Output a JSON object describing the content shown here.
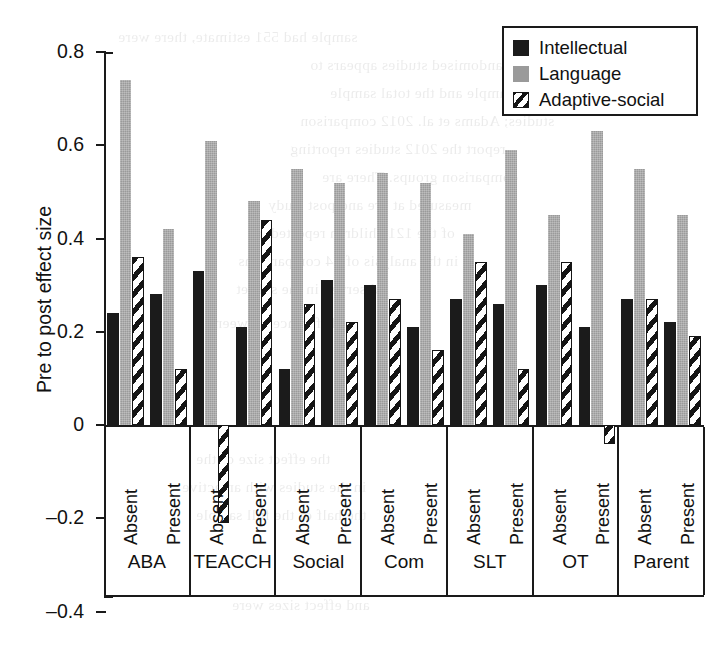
{
  "chart_data": {
    "type": "bar",
    "title": "",
    "xlabel": "",
    "ylabel": "Pre to post effect size",
    "ylim": [
      -0.4,
      0.8
    ],
    "yticks": [
      "0.8",
      "0.6",
      "0.4",
      "0.2",
      "0",
      "–0.2",
      "–0.4"
    ],
    "ytick_values": [
      0.8,
      0.6,
      0.4,
      0.2,
      0,
      -0.2,
      -0.4
    ],
    "grid": false,
    "legend_position": "top-right",
    "legend": [
      "Intellectual",
      "Language",
      "Adaptive-social"
    ],
    "group_label_row": [
      "ABA",
      "TEACCH",
      "Social",
      "Com",
      "SLT",
      "OT",
      "Parent"
    ],
    "subcategories": [
      "Absent",
      "Present"
    ],
    "categories": [
      "ABA Absent",
      "ABA Present",
      "TEACCH Absent",
      "TEACCH Present",
      "Social Absent",
      "Social Present",
      "Com Absent",
      "Com Present",
      "SLT Absent",
      "SLT Present",
      "OT Absent",
      "OT Present",
      "Parent Absent",
      "Parent Present"
    ],
    "series": [
      {
        "name": "Intellectual",
        "color": "#1b1b1b",
        "values": [
          0.24,
          0.28,
          0.33,
          0.21,
          0.12,
          0.31,
          0.3,
          0.21,
          0.27,
          0.26,
          0.3,
          0.21,
          0.27,
          0.22
        ]
      },
      {
        "name": "Language",
        "color": "#9a9a9a",
        "values": [
          0.74,
          0.42,
          0.61,
          0.48,
          0.55,
          0.52,
          0.54,
          0.52,
          0.41,
          0.59,
          0.45,
          0.63,
          0.55,
          0.45
        ]
      },
      {
        "name": "Adaptive-social",
        "color": "hatched",
        "values": [
          0.36,
          0.12,
          -0.21,
          0.44,
          0.26,
          0.22,
          0.27,
          0.16,
          0.35,
          0.12,
          0.35,
          -0.04,
          0.27,
          0.19
        ]
      }
    ]
  },
  "groups": [
    {
      "label": "ABA",
      "bars": [
        {
          "sub": "Absent",
          "intellectual": 0.24,
          "language": 0.74,
          "adaptive": 0.36
        },
        {
          "sub": "Present",
          "intellectual": 0.28,
          "language": 0.42,
          "adaptive": 0.12
        }
      ]
    },
    {
      "label": "TEACCH",
      "bars": [
        {
          "sub": "Absent",
          "intellectual": 0.33,
          "language": 0.61,
          "adaptive": -0.21
        },
        {
          "sub": "Present",
          "intellectual": 0.21,
          "language": 0.48,
          "adaptive": 0.44
        }
      ]
    },
    {
      "label": "Social",
      "bars": [
        {
          "sub": "Absent",
          "intellectual": 0.12,
          "language": 0.55,
          "adaptive": 0.26
        },
        {
          "sub": "Present",
          "intellectual": 0.31,
          "language": 0.52,
          "adaptive": 0.22
        }
      ]
    },
    {
      "label": "Com",
      "bars": [
        {
          "sub": "Absent",
          "intellectual": 0.3,
          "language": 0.54,
          "adaptive": 0.27
        },
        {
          "sub": "Present",
          "intellectual": 0.21,
          "language": 0.52,
          "adaptive": 0.16
        }
      ]
    },
    {
      "label": "SLT",
      "bars": [
        {
          "sub": "Absent",
          "intellectual": 0.27,
          "language": 0.41,
          "adaptive": 0.35
        },
        {
          "sub": "Present",
          "intellectual": 0.26,
          "language": 0.59,
          "adaptive": 0.12
        }
      ]
    },
    {
      "label": "OT",
      "bars": [
        {
          "sub": "Absent",
          "intellectual": 0.3,
          "language": 0.45,
          "adaptive": 0.35
        },
        {
          "sub": "Present",
          "intellectual": 0.21,
          "language": 0.63,
          "adaptive": -0.04
        }
      ]
    },
    {
      "label": "Parent",
      "bars": [
        {
          "sub": "Absent",
          "intellectual": 0.27,
          "language": 0.55,
          "adaptive": 0.27
        },
        {
          "sub": "Present",
          "intellectual": 0.22,
          "language": 0.45,
          "adaptive": 0.19
        }
      ]
    }
  ],
  "legend": {
    "items": [
      {
        "key": "intellectual",
        "label": "Intellectual"
      },
      {
        "key": "language",
        "label": "Language"
      },
      {
        "key": "adaptive",
        "label": "Adaptive-social"
      }
    ]
  },
  "ghost_text": [
    {
      "t": "sample had 551 estimate, there were",
      "x": 118,
      "y": 28
    },
    {
      "t": "the non-randomised studies appears to",
      "x": 310,
      "y": 56
    },
    {
      "t": "that sample and the total sample",
      "x": 330,
      "y": 84
    },
    {
      "t": "studies; Adams et al. 2012 comparison",
      "x": 300,
      "y": 112
    },
    {
      "t": "report the 2012 studies reporting",
      "x": 290,
      "y": 140
    },
    {
      "t": "comparison groups. There are",
      "x": 322,
      "y": 168
    },
    {
      "t": "measured at pre and post study",
      "x": 268,
      "y": 196
    },
    {
      "t": "of the 121 children reported on",
      "x": 250,
      "y": 224
    },
    {
      "t": "in the analysis of 44 comparisons",
      "x": 238,
      "y": 252
    },
    {
      "t": "observed in the subset",
      "x": 236,
      "y": 280
    },
    {
      "t": "difference between",
      "x": 214,
      "y": 314
    },
    {
      "t": "the effect size of the",
      "x": 196,
      "y": 450
    },
    {
      "t": "in the studies with an active",
      "x": 182,
      "y": 478
    },
    {
      "t": "the half of the full sample",
      "x": 196,
      "y": 506
    },
    {
      "t": "and effect sizes were",
      "x": 232,
      "y": 596
    }
  ]
}
